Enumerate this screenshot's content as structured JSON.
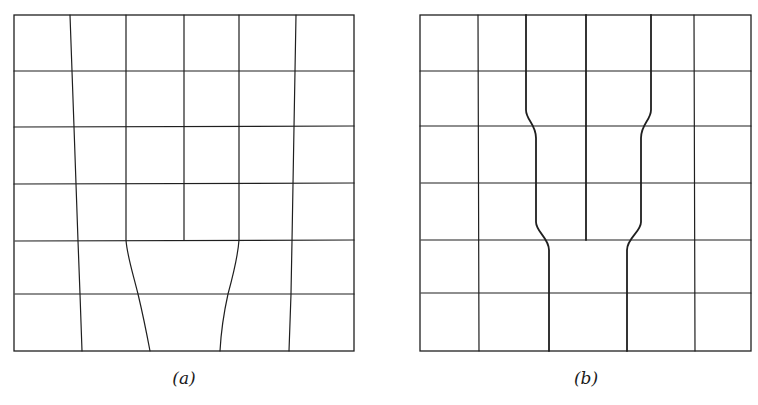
{
  "figure": {
    "panels": [
      {
        "id": "a",
        "label": "(a)",
        "description": "6x6 grid with the two central-bottom columns flaring outward and merging into one wide cell in the bottom two rows",
        "rows": 6,
        "cols": 6
      },
      {
        "id": "b",
        "label": "(b)",
        "description": "6x6 grid with central columns necking inward in rows 3-4 and merging into one wide cell in the bottom two rows",
        "rows": 6,
        "cols": 6
      }
    ],
    "colors": {
      "line": "#1f1f1f",
      "background": "#ffffff"
    }
  }
}
